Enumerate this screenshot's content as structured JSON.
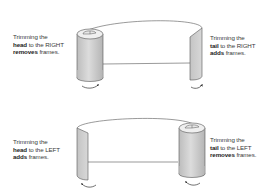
{
  "panels": [
    {
      "id": "head-right",
      "line1": "Trimming the",
      "bold1": "head",
      "line2_rest": " to the RIGHT",
      "bold2": "removes",
      "line3_rest": " frames.",
      "edge": "head",
      "direction": "RIGHT",
      "effect": "removes",
      "shape": "rolled-cylinder-left"
    },
    {
      "id": "tail-right",
      "line1": "Trimming the",
      "bold1": "tail",
      "line2_rest": " to the RIGHT",
      "bold2": "adds",
      "line3_rest": " frames.",
      "edge": "tail",
      "direction": "RIGHT",
      "effect": "adds",
      "shape": "flat-edge-right"
    },
    {
      "id": "head-left",
      "line1": "Trimming the",
      "bold1": "head",
      "line2_rest": " to the LEFT",
      "bold2": "adds",
      "line3_rest": " frames.",
      "edge": "head",
      "direction": "LEFT",
      "effect": "adds",
      "shape": "flat-edge-left"
    },
    {
      "id": "tail-left",
      "line1": "Trimming the",
      "bold1": "tail",
      "line2_rest": " to the LEFT",
      "bold2": "removes",
      "line3_rest": " frames.",
      "edge": "tail",
      "direction": "LEFT",
      "effect": "removes",
      "shape": "rolled-cylinder-right"
    }
  ],
  "colors": {
    "stroke": "#555555",
    "fill_shade": "#c8c8c8",
    "fill_light": "#e4e4e4",
    "text": "#3a3a3a",
    "background": "#ffffff"
  },
  "icons": {
    "arrow": "curved-rotation-arrow"
  }
}
